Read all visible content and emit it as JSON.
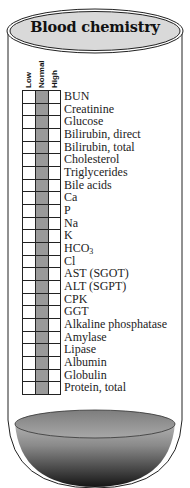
{
  "title": "Blood chemistry",
  "columns": [
    {
      "label": "Low",
      "shade": "#ffffff"
    },
    {
      "label": "Normal",
      "shade": "#9a9a9a"
    },
    {
      "label": "High",
      "shade": "#ffffff"
    }
  ],
  "tests": [
    {
      "label": "BUN"
    },
    {
      "label": "Creatinine"
    },
    {
      "label": "Glucose"
    },
    {
      "label": "Bilirubin, direct"
    },
    {
      "label": "Bilirubin, total"
    },
    {
      "label": "Cholesterol"
    },
    {
      "label": "Triglycerides"
    },
    {
      "label": "Bile acids"
    },
    {
      "label": "Ca"
    },
    {
      "label": "P"
    },
    {
      "label": "Na"
    },
    {
      "label": "K"
    },
    {
      "label": "HCO3",
      "base": "HCO",
      "sub": "3"
    },
    {
      "label": "Cl"
    },
    {
      "label": "AST (SGOT)"
    },
    {
      "label": "ALT (SGPT)"
    },
    {
      "label": "CPK"
    },
    {
      "label": "GGT"
    },
    {
      "label": "Alkaline phosphatase"
    },
    {
      "label": "Amylase"
    },
    {
      "label": "Lipase"
    },
    {
      "label": "Albumin"
    },
    {
      "label": "Globulin"
    },
    {
      "label": "Protein, total"
    }
  ],
  "colors": {
    "outline": "#222222",
    "cap_fill": "#d8d8d8",
    "normal_band": "#9a9a9a",
    "blood_light": "#bdbdbd",
    "blood_dark": "#1a1a1a"
  }
}
